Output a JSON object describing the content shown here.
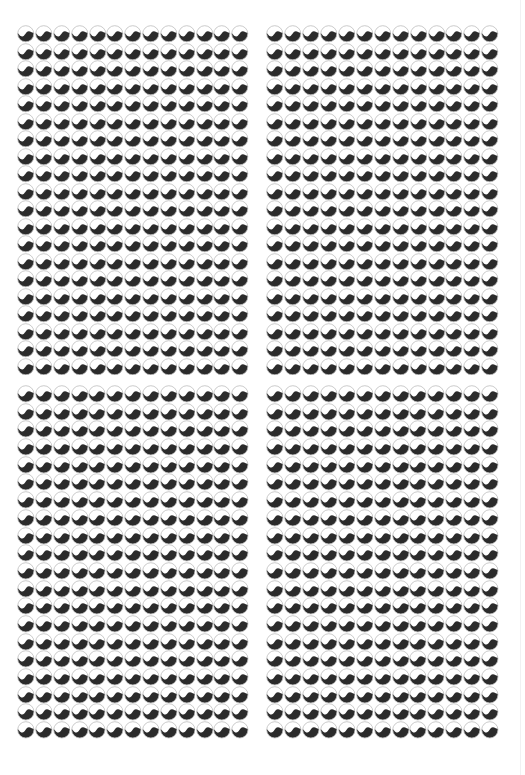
{
  "page": {
    "background": "#ffffff",
    "edge_line_color": "#f1f1f3"
  },
  "pattern": {
    "motif": "yin-yang-wave-circle",
    "fill_top": "#ffffff",
    "fill_bottom": "#2b2b2b",
    "outline": "#bdbdbd",
    "columns": 13,
    "rows": 20
  },
  "panels": [
    {
      "id": "top-left",
      "x": 17,
      "y": 25,
      "width": 232,
      "height": 342
    },
    {
      "id": "top-right",
      "x": 266,
      "y": 25,
      "width": 233,
      "height": 342
    },
    {
      "id": "bottom-left",
      "x": 17,
      "y": 385,
      "width": 232,
      "height": 346
    },
    {
      "id": "bottom-right",
      "x": 266,
      "y": 385,
      "width": 233,
      "height": 346
    }
  ]
}
